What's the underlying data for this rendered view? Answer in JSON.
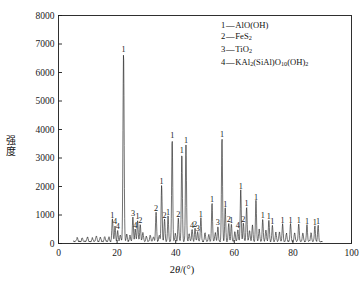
{
  "chart_data": {
    "type": "line",
    "title": "",
    "subtitle": "",
    "xlabel": "2θ/(°)",
    "ylabel": "强度",
    "xlim": [
      0,
      100
    ],
    "ylim": [
      0,
      8000
    ],
    "xticks": [
      0,
      20,
      40,
      60,
      80,
      100
    ],
    "yticks": [
      0,
      1000,
      2000,
      3000,
      4000,
      5000,
      6000,
      7000,
      8000
    ],
    "grid": false,
    "legend_position": "top-right",
    "legend": [
      {
        "key": "1",
        "dash": "—",
        "label": "AlO(OH)"
      },
      {
        "key": "2",
        "dash": "—",
        "label": "FeS2"
      },
      {
        "key": "3",
        "dash": "—",
        "label": "TiO2"
      },
      {
        "key": "4",
        "dash": "—",
        "label": "KAl2(SiAl)O10(OH)2"
      }
    ],
    "series": [
      {
        "name": "XRD pattern",
        "x_start": 5,
        "x_end": 90,
        "baseline": 70,
        "peaks": [
          {
            "x": 6.4,
            "y": 130,
            "w": 0.3,
            "label": ""
          },
          {
            "x": 8.1,
            "y": 115,
            "w": 0.28,
            "label": ""
          },
          {
            "x": 9.9,
            "y": 150,
            "w": 0.3,
            "label": ""
          },
          {
            "x": 11.6,
            "y": 120,
            "w": 0.28,
            "label": ""
          },
          {
            "x": 12.9,
            "y": 190,
            "w": 0.3,
            "label": ""
          },
          {
            "x": 14.3,
            "y": 140,
            "w": 0.28,
            "label": ""
          },
          {
            "x": 15.8,
            "y": 165,
            "w": 0.3,
            "label": ""
          },
          {
            "x": 17.2,
            "y": 150,
            "w": 0.28,
            "label": ""
          },
          {
            "x": 18.4,
            "y": 790,
            "w": 0.26,
            "label": "1"
          },
          {
            "x": 19.3,
            "y": 560,
            "w": 0.24,
            "label": "4"
          },
          {
            "x": 20.2,
            "y": 380,
            "w": 0.24,
            "label": "4"
          },
          {
            "x": 21.1,
            "y": 230,
            "w": 0.26,
            "label": ""
          },
          {
            "x": 22.2,
            "y": 6620,
            "w": 0.26,
            "label": "1"
          },
          {
            "x": 23.3,
            "y": 250,
            "w": 0.26,
            "label": ""
          },
          {
            "x": 24.4,
            "y": 210,
            "w": 0.26,
            "label": ""
          },
          {
            "x": 25.4,
            "y": 860,
            "w": 0.24,
            "label": "3"
          },
          {
            "x": 26.2,
            "y": 430,
            "w": 0.24,
            "label": "4"
          },
          {
            "x": 27.0,
            "y": 740,
            "w": 0.24,
            "label": "1"
          },
          {
            "x": 27.9,
            "y": 620,
            "w": 0.24,
            "label": "2"
          },
          {
            "x": 28.8,
            "y": 300,
            "w": 0.26,
            "label": ""
          },
          {
            "x": 30.0,
            "y": 180,
            "w": 0.28,
            "label": ""
          },
          {
            "x": 31.3,
            "y": 210,
            "w": 0.28,
            "label": ""
          },
          {
            "x": 32.4,
            "y": 160,
            "w": 0.28,
            "label": ""
          },
          {
            "x": 33.3,
            "y": 1020,
            "w": 0.24,
            "label": "2"
          },
          {
            "x": 34.4,
            "y": 230,
            "w": 0.26,
            "label": ""
          },
          {
            "x": 35.2,
            "y": 1980,
            "w": 0.24,
            "label": "1"
          },
          {
            "x": 36.2,
            "y": 790,
            "w": 0.24,
            "label": "2"
          },
          {
            "x": 37.4,
            "y": 880,
            "w": 0.24,
            "label": "1"
          },
          {
            "x": 38.8,
            "y": 3580,
            "w": 0.24,
            "label": "1"
          },
          {
            "x": 39.9,
            "y": 280,
            "w": 0.26,
            "label": ""
          },
          {
            "x": 40.9,
            "y": 820,
            "w": 0.24,
            "label": "2"
          },
          {
            "x": 42.1,
            "y": 3070,
            "w": 0.24,
            "label": "1"
          },
          {
            "x": 43.5,
            "y": 3400,
            "w": 0.24,
            "label": "1"
          },
          {
            "x": 44.6,
            "y": 260,
            "w": 0.26,
            "label": ""
          },
          {
            "x": 45.6,
            "y": 440,
            "w": 0.24,
            "label": "4"
          },
          {
            "x": 46.6,
            "y": 470,
            "w": 0.24,
            "label": "2"
          },
          {
            "x": 47.5,
            "y": 330,
            "w": 0.24,
            "label": "3"
          },
          {
            "x": 48.6,
            "y": 820,
            "w": 0.24,
            "label": "1"
          },
          {
            "x": 50.0,
            "y": 300,
            "w": 0.26,
            "label": ""
          },
          {
            "x": 51.3,
            "y": 240,
            "w": 0.26,
            "label": ""
          },
          {
            "x": 52.4,
            "y": 1340,
            "w": 0.24,
            "label": "1"
          },
          {
            "x": 53.5,
            "y": 300,
            "w": 0.26,
            "label": ""
          },
          {
            "x": 54.4,
            "y": 520,
            "w": 0.24,
            "label": "3"
          },
          {
            "x": 55.8,
            "y": 3630,
            "w": 0.24,
            "label": "1"
          },
          {
            "x": 56.9,
            "y": 1180,
            "w": 0.24,
            "label": "1"
          },
          {
            "x": 58.1,
            "y": 640,
            "w": 0.24,
            "label": "2"
          },
          {
            "x": 59.0,
            "y": 620,
            "w": 0.24,
            "label": "1"
          },
          {
            "x": 60.2,
            "y": 330,
            "w": 0.26,
            "label": ""
          },
          {
            "x": 61.2,
            "y": 420,
            "w": 0.24,
            "label": "4"
          },
          {
            "x": 62.2,
            "y": 1790,
            "w": 0.24,
            "label": "1"
          },
          {
            "x": 63.1,
            "y": 640,
            "w": 0.24,
            "label": "2"
          },
          {
            "x": 64.2,
            "y": 1220,
            "w": 0.24,
            "label": "1"
          },
          {
            "x": 65.2,
            "y": 380,
            "w": 0.26,
            "label": ""
          },
          {
            "x": 66.2,
            "y": 560,
            "w": 0.26,
            "label": ""
          },
          {
            "x": 67.4,
            "y": 1430,
            "w": 0.24,
            "label": "1"
          },
          {
            "x": 68.5,
            "y": 420,
            "w": 0.26,
            "label": ""
          },
          {
            "x": 69.7,
            "y": 780,
            "w": 0.24,
            "label": "1"
          },
          {
            "x": 70.8,
            "y": 410,
            "w": 0.26,
            "label": ""
          },
          {
            "x": 71.8,
            "y": 760,
            "w": 0.24,
            "label": "1"
          },
          {
            "x": 73.0,
            "y": 560,
            "w": 0.24,
            "label": "1"
          },
          {
            "x": 74.2,
            "y": 320,
            "w": 0.26,
            "label": ""
          },
          {
            "x": 75.4,
            "y": 330,
            "w": 0.26,
            "label": ""
          },
          {
            "x": 76.5,
            "y": 620,
            "w": 0.24,
            "label": "1"
          },
          {
            "x": 77.8,
            "y": 280,
            "w": 0.26,
            "label": ""
          },
          {
            "x": 79.2,
            "y": 620,
            "w": 0.24,
            "label": "1"
          },
          {
            "x": 80.6,
            "y": 300,
            "w": 0.26,
            "label": ""
          },
          {
            "x": 82.0,
            "y": 620,
            "w": 0.24,
            "label": "1"
          },
          {
            "x": 83.4,
            "y": 300,
            "w": 0.26,
            "label": ""
          },
          {
            "x": 84.8,
            "y": 580,
            "w": 0.24,
            "label": "1"
          },
          {
            "x": 86.2,
            "y": 300,
            "w": 0.26,
            "label": ""
          },
          {
            "x": 87.5,
            "y": 540,
            "w": 0.24,
            "label": "1"
          },
          {
            "x": 88.6,
            "y": 560,
            "w": 0.24,
            "label": "1"
          }
        ]
      }
    ],
    "colors": {
      "line": "#1a1a1a",
      "axis": "#1a1a1a",
      "background": "#ffffff"
    }
  }
}
